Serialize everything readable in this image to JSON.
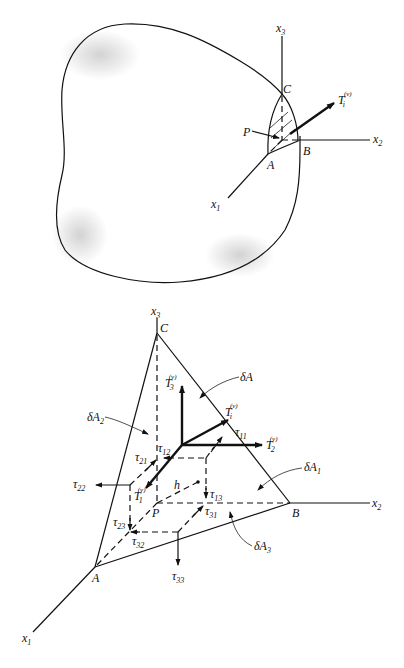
{
  "figure_top": {
    "description": "Arbitrary body with tetrahedron element at point P and traction vector",
    "axes": {
      "x1": "x",
      "x2": "x",
      "x3": "x",
      "x1_sub": "1",
      "x2_sub": "2",
      "x3_sub": "3"
    },
    "points": {
      "C": "C",
      "P": "P",
      "A": "A",
      "B": "B"
    },
    "traction": {
      "base": "T",
      "sub": "i",
      "sup": "(ν)"
    }
  },
  "figure_bottom": {
    "description": "Tetrahedron element with stress components and traction vectors",
    "axes": {
      "x1": "x",
      "x2": "x",
      "x3": "x",
      "x1_sub": "1",
      "x2_sub": "2",
      "x3_sub": "3"
    },
    "points": {
      "C": "C",
      "P": "P",
      "A": "A",
      "B": "B",
      "h": "h"
    },
    "tractions": [
      {
        "base": "T",
        "sub": "i",
        "sup": "(ν)"
      },
      {
        "base": "T",
        "sub": "1",
        "sup": "(ν)"
      },
      {
        "base": "T",
        "sub": "2",
        "sup": "(ν)"
      },
      {
        "base": "T",
        "sub": "3",
        "sup": "(ν)"
      }
    ],
    "areas": [
      {
        "base": "δA",
        "sub": ""
      },
      {
        "base": "δA",
        "sub": "1"
      },
      {
        "base": "δA",
        "sub": "2"
      },
      {
        "base": "δA",
        "sub": "3"
      }
    ],
    "stresses": [
      {
        "base": "τ",
        "sub": "11"
      },
      {
        "base": "τ",
        "sub": "12"
      },
      {
        "base": "τ",
        "sub": "13"
      },
      {
        "base": "τ",
        "sub": "21"
      },
      {
        "base": "τ",
        "sub": "22"
      },
      {
        "base": "τ",
        "sub": "23"
      },
      {
        "base": "τ",
        "sub": "31"
      },
      {
        "base": "τ",
        "sub": "32"
      },
      {
        "base": "τ",
        "sub": "33"
      }
    ]
  }
}
